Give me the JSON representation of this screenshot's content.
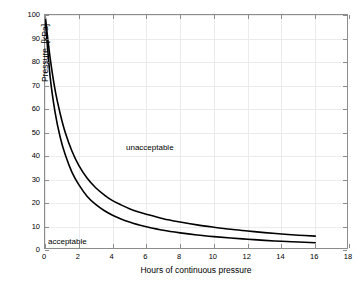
{
  "chart_data": {
    "type": "line",
    "title": "",
    "subtitle": "",
    "xlabel": "Hours of continuous pressure",
    "ylabel": "Pressure, [kPa]",
    "xlim": [
      0,
      18
    ],
    "ylim": [
      0,
      100
    ],
    "xticks": [
      0,
      2,
      4,
      6,
      8,
      10,
      12,
      14,
      16,
      18
    ],
    "xtick_labels": [
      "0",
      "2",
      "4",
      "6",
      "8",
      "10",
      "12",
      "14",
      "16",
      "18"
    ],
    "yticks": [
      0,
      10,
      20,
      30,
      40,
      50,
      60,
      70,
      80,
      90,
      100
    ],
    "ytick_labels": [
      "0",
      "10",
      "20",
      "30",
      "40",
      "50",
      "60",
      "70",
      "80",
      "90",
      "100"
    ],
    "grid": true,
    "legend": "none",
    "line_color": "#000000",
    "grid_color": "#ebebeb",
    "axis_color": "#8c8c8c",
    "series": [
      {
        "name": "upper-threshold-curve",
        "x": [
          0.0,
          0.3,
          0.6,
          0.9,
          1.2,
          1.6,
          2.0,
          2.5,
          3.0,
          3.5,
          4.0,
          4.5,
          5.0,
          5.5,
          6.0,
          7.0,
          8.0,
          9.0,
          10.0,
          11.0,
          12.0,
          13.0,
          14.0,
          15.0,
          16.0
        ],
        "y": [
          100.0,
          82.0,
          68.0,
          58.0,
          50.0,
          42.0,
          36.0,
          30.5,
          26.5,
          23.5,
          21.0,
          19.2,
          17.6,
          16.3,
          15.2,
          13.3,
          11.9,
          10.7,
          9.7,
          8.8,
          8.1,
          7.4,
          6.8,
          6.3,
          5.9
        ]
      },
      {
        "name": "lower-threshold-curve",
        "x": [
          0.0,
          0.3,
          0.6,
          0.9,
          1.2,
          1.6,
          2.0,
          2.5,
          3.0,
          3.5,
          4.0,
          4.5,
          5.0,
          5.5,
          6.0,
          7.0,
          8.0,
          9.0,
          10.0,
          11.0,
          12.0,
          13.0,
          14.0,
          15.0,
          16.0
        ],
        "y": [
          100.0,
          74.0,
          58.5,
          48.0,
          40.5,
          33.0,
          27.8,
          22.8,
          19.4,
          16.8,
          14.8,
          13.2,
          11.9,
          10.8,
          9.9,
          8.4,
          7.3,
          6.4,
          5.7,
          5.1,
          4.6,
          4.1,
          3.7,
          3.4,
          3.1
        ]
      }
    ],
    "annotations": [
      {
        "name": "unacceptable",
        "text": "unacceptable",
        "x": 5.0,
        "y": 46.0
      },
      {
        "name": "acceptable",
        "text": "acceptable",
        "x": 0.3,
        "y": 5.5
      }
    ]
  }
}
